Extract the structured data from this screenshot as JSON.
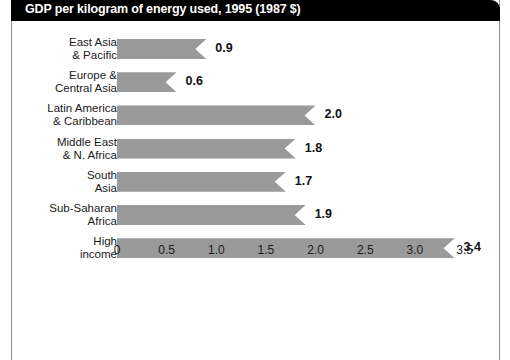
{
  "chart_data": {
    "type": "bar",
    "orientation": "horizontal",
    "title": "GDP per kilogram of energy used, 1995 (1987 $)",
    "xlabel": "",
    "ylabel": "",
    "xlim": [
      0,
      3.5
    ],
    "xticks": [
      "0",
      "0.5",
      "1.0",
      "1.5",
      "2.0",
      "2.5",
      "3.0",
      "3.5"
    ],
    "xtick_values": [
      0,
      0.5,
      1.0,
      1.5,
      2.0,
      2.5,
      3.0,
      3.5
    ],
    "grid": false,
    "legend": false,
    "categories": [
      "East Asia\n& Pacific",
      "Europe &\nCentral Asia",
      "Latin America\n& Caribbean",
      "Middle East\n& N. Africa",
      "South\nAsia",
      "Sub-Saharan\nAfrica",
      "High\nincome"
    ],
    "values": [
      0.9,
      0.6,
      2.0,
      1.8,
      1.7,
      1.9,
      3.4
    ],
    "value_labels": [
      "0.9",
      "0.6",
      "2.0",
      "1.8",
      "1.7",
      "1.9",
      "3.4"
    ],
    "bar_color": "#9a9a9a",
    "title_band_color": "#000000",
    "title_text_color": "#ffffff",
    "frame_color": "#8d8d8d",
    "background_color": "#ffffff"
  }
}
